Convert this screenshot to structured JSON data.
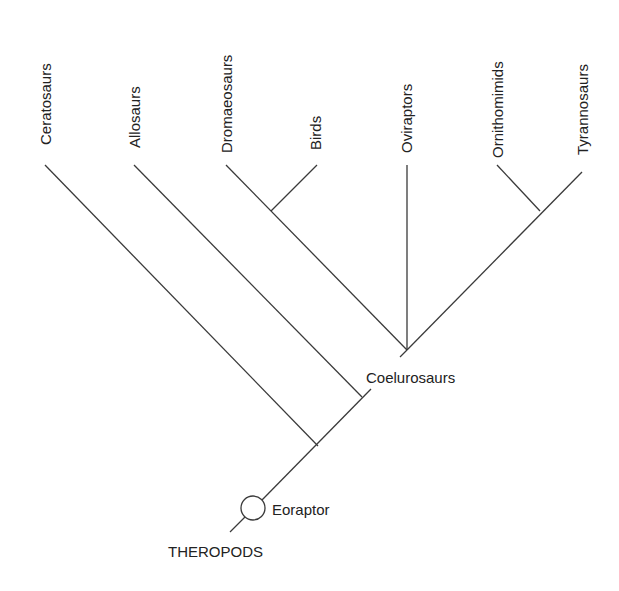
{
  "diagram": {
    "type": "cladogram",
    "root_label": "THEROPODS",
    "ancestor_label": "Eoraptor",
    "clade_label": "Coelurosaurs",
    "line_color": "#3a3a3a",
    "text_color": "#222222",
    "taxa": [
      {
        "id": "ceratosaurs",
        "label": "Ceratosaurs"
      },
      {
        "id": "allosaurs",
        "label": "Allosaurs"
      },
      {
        "id": "dromaeosaurs",
        "label": "Dromaeosaurs"
      },
      {
        "id": "birds",
        "label": "Birds"
      },
      {
        "id": "oviraptors",
        "label": "Oviraptors"
      },
      {
        "id": "ornithomimids",
        "label": "Ornithomimids"
      },
      {
        "id": "tyrannosaurs",
        "label": "Tyrannosaurs"
      }
    ],
    "groupings": [
      {
        "node": "Dromaeosaurs + Birds"
      },
      {
        "node": "Ornithomimids + Tyrannosaurs"
      },
      {
        "node": "Coelurosaurs",
        "members": [
          "Dromaeosaurs",
          "Birds",
          "Oviraptors",
          "Ornithomimids",
          "Tyrannosaurs"
        ]
      },
      {
        "node": "Allosaurs + Coelurosaurs"
      },
      {
        "node": "Theropods",
        "members": [
          "Ceratosaurs",
          "Allosaurs",
          "Coelurosaurs"
        ]
      }
    ]
  }
}
